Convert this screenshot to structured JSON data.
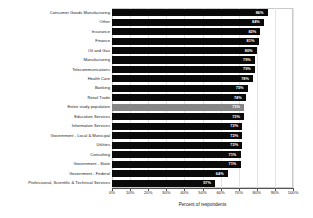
{
  "chart_data": {
    "type": "bar",
    "orientation": "horizontal",
    "title": "",
    "xlabel": "Percent of respondents",
    "ylabel": "",
    "xlim": [
      0,
      100
    ],
    "xticks": [
      "0%",
      "10%",
      "20%",
      "30%",
      "40%",
      "50%",
      "60%",
      "70%",
      "80%",
      "90%",
      "100%"
    ],
    "xtick_values": [
      0,
      10,
      20,
      30,
      40,
      50,
      60,
      70,
      80,
      90,
      100
    ],
    "grid": true,
    "legend": false,
    "bar_color": "#0a0a0a",
    "highlight_color": "#868686",
    "highlight_category": "Entire study population",
    "categories": [
      "Consumer Goods Manufacturing",
      "Other",
      "Insurance",
      "Finance",
      "Oil and Gas",
      "Manufacturing",
      "Telecommunications",
      "Health Care",
      "Banking",
      "Retail Trade",
      "Entire study population",
      "Education Services",
      "Information Services",
      "Government - Local & Municipal",
      "Utilities",
      "Consulting",
      "Government - State",
      "Government - Federal",
      "Professional, Scientific & Technical Services"
    ],
    "values": [
      86,
      84,
      82,
      81,
      80,
      79,
      79,
      78,
      75,
      74,
      73,
      73,
      72,
      72,
      72,
      71,
      71,
      64,
      57
    ],
    "value_labels": [
      "86%",
      "84%",
      "82%",
      "81%",
      "80%",
      "79%",
      "79%",
      "78%",
      "75%",
      "74%",
      "73%",
      "73%",
      "72%",
      "72%",
      "72%",
      "71%",
      "71%",
      "64%",
      "57%"
    ]
  }
}
